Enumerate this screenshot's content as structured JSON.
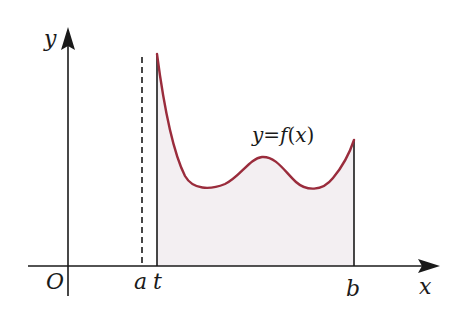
{
  "diagram": {
    "title": "",
    "type": "function-graph-area-under-curve",
    "colors": {
      "background": "#ffffff",
      "axis": "#1a1a1a",
      "curve": "#9a2c3c",
      "area_fill": "#f3eff2",
      "text": "#1a1a1a"
    },
    "axes": {
      "x_label": "x",
      "y_label": "y",
      "origin_label": "O"
    },
    "curve": {
      "label": "y=f(x)",
      "label_parts": {
        "y": "y",
        "eq": "=",
        "f": "f",
        "open": "(",
        "x": "x",
        "close": ")"
      }
    },
    "markers": [
      {
        "id": "a",
        "label": "a",
        "style": "dashed"
      },
      {
        "id": "t",
        "label": "t",
        "style": "solid"
      },
      {
        "id": "b",
        "label": "b",
        "style": "solid"
      }
    ],
    "shaded_region": {
      "description": "Area under y=f(x) between x=t and x=b",
      "from": "t",
      "to": "b"
    }
  }
}
